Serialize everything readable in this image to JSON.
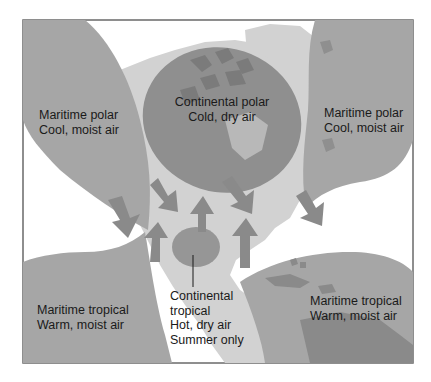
{
  "colors": {
    "maritime_region": "#a6a6a6",
    "continental_polar_region": "#8f8f8f",
    "continental_tropical_region": "#969696",
    "light_land": "#d2d2d2",
    "dark_land": "#7b7b7b",
    "arrow": "#8a8a8a",
    "frame": "#6a6a6a",
    "background": "#ffffff"
  },
  "air_masses": [
    {
      "id": "mp-west",
      "name": "Maritime polar",
      "description": "Cool, moist air"
    },
    {
      "id": "cp",
      "name": "Continental polar",
      "description": "Cold, dry air"
    },
    {
      "id": "mp-east",
      "name": "Maritime polar",
      "description": "Cool, moist air"
    },
    {
      "id": "mt-west",
      "name": "Maritime tropical",
      "description": "Warm, moist air"
    },
    {
      "id": "ct",
      "name": "Continental",
      "name2": "tropical",
      "description": "Hot, dry air",
      "note": "Summer only"
    },
    {
      "id": "mt-east",
      "name": "Maritime tropical",
      "description": "Warm, moist air"
    }
  ]
}
